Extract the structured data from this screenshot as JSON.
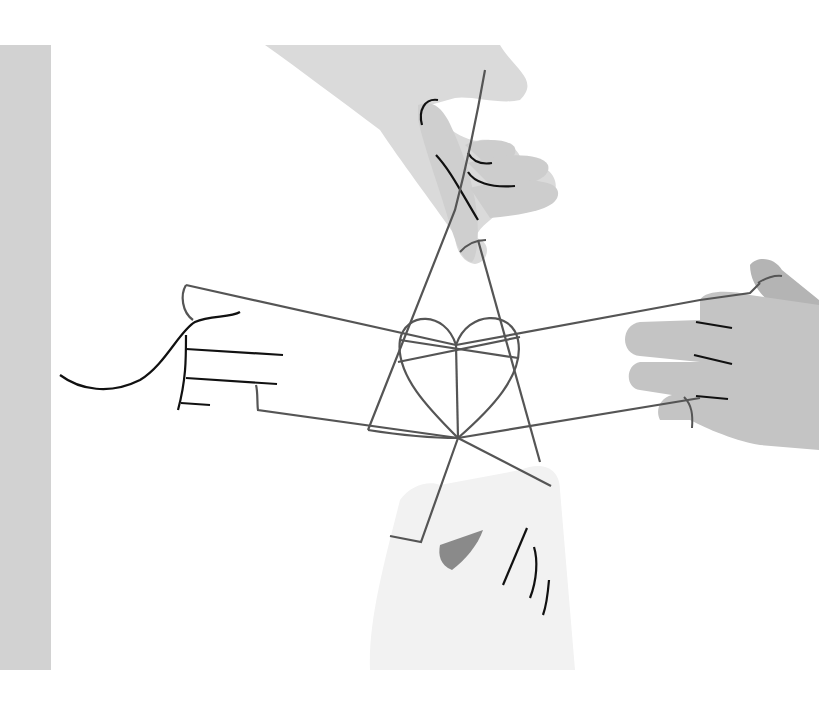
{
  "illustration": {
    "title": "Hands weaving a string figure with a heart in the center",
    "colors": {
      "background": "#ffffff",
      "left_strip": "#d2d2d2",
      "hand_top": "#dadada",
      "hand_top_fingers": "#cdcdcd",
      "hand_right": "#c4c4c4",
      "hand_right_thumb": "#b4b4b4",
      "hand_bottom": "#f2f2f2",
      "nail": "#8a8a8a",
      "string": "#555555",
      "ink": "#111111"
    },
    "elements": [
      "left-gray-strip",
      "top-hand",
      "right-hand",
      "bottom-hand",
      "left-hand-outline",
      "string-figure",
      "heart"
    ]
  }
}
